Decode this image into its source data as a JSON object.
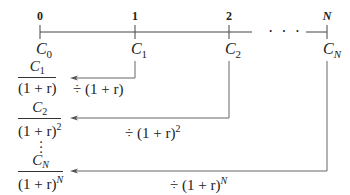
{
  "timeline": {
    "periods": [
      "0",
      "1",
      "2",
      "N"
    ],
    "ellipsis": "· · ·",
    "cash_flows": [
      {
        "base": "C",
        "sub": "0"
      },
      {
        "base": "C",
        "sub": "1"
      },
      {
        "base": "C",
        "sub": "2"
      },
      {
        "base": "C",
        "sub": "N"
      }
    ]
  },
  "discounted": [
    {
      "num_base": "C",
      "num_sub": "1",
      "den": "(1 + r)",
      "den_exp": "",
      "op": "÷ (1 + r)",
      "op_exp": ""
    },
    {
      "num_base": "C",
      "num_sub": "2",
      "den": "(1 + r)",
      "den_exp": "2",
      "op": "÷ (1 + r)",
      "op_exp": "2"
    },
    {
      "num_base": "C",
      "num_sub": "N",
      "den": "(1 + r)",
      "den_exp": "N",
      "op": "÷ (1 + r)",
      "op_exp": "N"
    }
  ],
  "vertical_ellipsis": "·\n·\n·",
  "colors": {
    "line": "#555555",
    "text": "#222222"
  }
}
